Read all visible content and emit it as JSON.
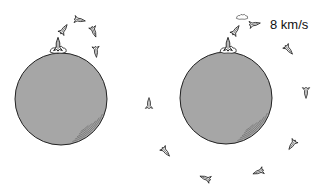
{
  "figure": {
    "type": "illustration",
    "colors": {
      "planet_fill": "#a6a6a6",
      "outline": "#222222",
      "background": "#ffffff"
    },
    "panels": [
      {
        "id": "left",
        "planet": {
          "cx": 61,
          "cy": 99,
          "r": 46
        },
        "launch_site": {
          "x": 58,
          "y": 50
        },
        "rockets": [
          {
            "x": 58,
            "y": 44,
            "angle": 0,
            "scale": 1.1
          },
          {
            "x": 64,
            "y": 29,
            "angle": 35,
            "scale": 0.9
          },
          {
            "x": 80,
            "y": 20,
            "angle": 100,
            "scale": 0.9
          },
          {
            "x": 94,
            "y": 32,
            "angle": 160,
            "scale": 0.9
          },
          {
            "x": 96,
            "y": 52,
            "angle": 175,
            "scale": 0.9
          },
          {
            "x": 149,
            "y": 103,
            "angle": 0,
            "scale": 0.9
          },
          {
            "x": 166,
            "y": 152,
            "angle": 140,
            "scale": 0.9
          }
        ]
      },
      {
        "id": "right",
        "planet": {
          "cx": 226,
          "cy": 98,
          "r": 46
        },
        "launch_site": {
          "x": 228,
          "y": 50
        },
        "rockets": [
          {
            "x": 228,
            "y": 44,
            "angle": 0,
            "scale": 1.1
          },
          {
            "x": 236,
            "y": 30,
            "angle": 35,
            "scale": 0.9
          },
          {
            "x": 255,
            "y": 24,
            "angle": 80,
            "scale": 0.9
          },
          {
            "x": 289,
            "y": 50,
            "angle": 140,
            "scale": 0.9
          },
          {
            "x": 306,
            "y": 93,
            "angle": 180,
            "scale": 0.9
          },
          {
            "x": 292,
            "y": 145,
            "angle": 215,
            "scale": 0.9
          },
          {
            "x": 258,
            "y": 172,
            "angle": 250,
            "scale": 0.9
          },
          {
            "x": 205,
            "y": 178,
            "angle": 290,
            "scale": 0.9
          }
        ],
        "velocity_label": "8 km/s"
      }
    ]
  }
}
